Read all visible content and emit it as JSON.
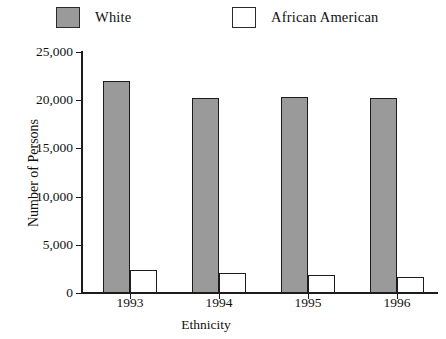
{
  "chart_data": {
    "type": "bar",
    "title": "",
    "xlabel": "Ethnicity",
    "ylabel": "Number of Persons",
    "categories": [
      "1993",
      "1994",
      "1995",
      "1996"
    ],
    "ylim": [
      0,
      25000
    ],
    "ytick_labels": [
      "0",
      "5,000",
      "10,000",
      "15,000",
      "20,000",
      "25,000"
    ],
    "ytick_values": [
      0,
      5000,
      10000,
      15000,
      20000,
      25000
    ],
    "grid": false,
    "legend_position": "top",
    "series": [
      {
        "name": "White",
        "color": "#9a9a9a",
        "values": [
          22000,
          20200,
          20300,
          20200
        ]
      },
      {
        "name": "African American",
        "color": "#ffffff",
        "values": [
          2400,
          2100,
          1900,
          1650
        ]
      }
    ]
  },
  "legend": {
    "items": [
      {
        "label": "White",
        "swatch": "filled-gray-square"
      },
      {
        "label": "African American",
        "swatch": "hollow-white-square"
      }
    ]
  },
  "colors": {
    "bar_fill_white_series": "#9a9a9a",
    "bar_fill_aa_series": "#ffffff",
    "axis": "#1c1c1c",
    "background": "#ffffff"
  }
}
